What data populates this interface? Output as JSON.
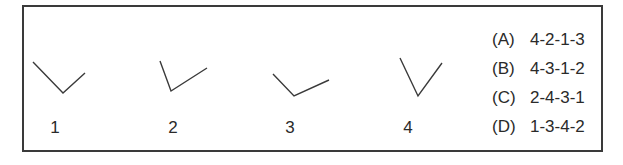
{
  "figures": [
    {
      "label": "1",
      "points": [
        [
          33,
          62
        ],
        [
          63,
          93
        ],
        [
          85,
          73
        ]
      ],
      "label_x": 55
    },
    {
      "label": "2",
      "points": [
        [
          160,
          61
        ],
        [
          171,
          91
        ],
        [
          207,
          68
        ]
      ],
      "label_x": 173
    },
    {
      "label": "3",
      "points": [
        [
          273,
          74
        ],
        [
          294,
          96
        ],
        [
          329,
          80
        ]
      ],
      "label_x": 290
    },
    {
      "label": "4",
      "points": [
        [
          400,
          58
        ],
        [
          418,
          96
        ],
        [
          442,
          63
        ]
      ],
      "label_x": 408
    }
  ],
  "options": [
    {
      "letter": "(A)",
      "sequence": "4-2-1-3"
    },
    {
      "letter": "(B)",
      "sequence": "4-3-1-2"
    },
    {
      "letter": "(C)",
      "sequence": "2-4-3-1"
    },
    {
      "letter": "(D)",
      "sequence": "1-3-4-2"
    }
  ],
  "colors": {
    "stroke": "#3a3a3a",
    "text": "#2a2a2a"
  }
}
